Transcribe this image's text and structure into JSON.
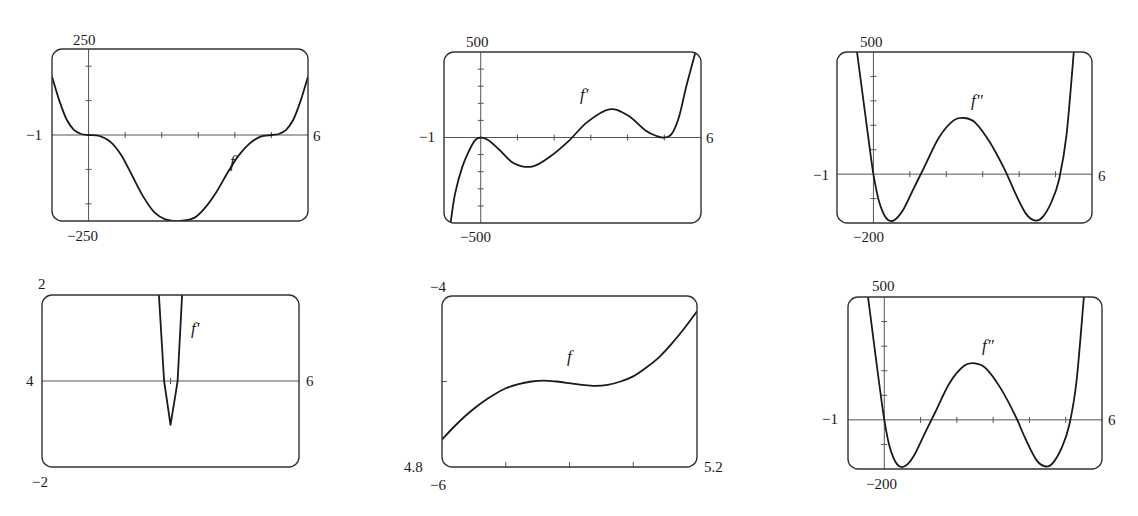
{
  "figure": {
    "stroke_color": "#1a1a1a",
    "frame_color": "#333333",
    "axis_color": "#555555",
    "background": "#ffffff"
  },
  "chart_data": [
    {
      "type": "line",
      "id": "p1",
      "curve_label": "f",
      "box": {
        "left": 52,
        "top": 49,
        "right": 308,
        "bottom": 221
      },
      "xlim": [
        -1,
        6
      ],
      "ylim": [
        -250,
        250
      ],
      "labels": {
        "ymax": "250",
        "ymin": "−250",
        "xmin": "−1",
        "xmax": "6"
      },
      "x_axis_y": 0,
      "y_axis_x": 0,
      "xticks": [
        1,
        2,
        3,
        4,
        5
      ],
      "yticks": [
        -200,
        -100,
        100,
        200
      ],
      "label_pos": {
        "ymax": [
          73,
          33
        ],
        "ymin": [
          67,
          229
        ],
        "xmin": [
          26,
          128
        ],
        "xmax": [
          313,
          129
        ],
        "fn": [
          230,
          153
        ]
      },
      "series": [
        {
          "name": "f",
          "x": [
            -1,
            -0.8,
            -0.6,
            -0.4,
            -0.2,
            0,
            0.3,
            0.6,
            0.9,
            1.2,
            1.5,
            1.8,
            2.1,
            2.5,
            2.9,
            3.2,
            3.5,
            3.8,
            4.1,
            4.4,
            4.7,
            5,
            5.2,
            5.4,
            5.6,
            5.8,
            6
          ],
          "y": [
            170,
            100,
            45,
            15,
            3,
            0,
            -3,
            -20,
            -60,
            -120,
            -180,
            -225,
            -245,
            -250,
            -240,
            -210,
            -165,
            -110,
            -60,
            -25,
            -5,
            0,
            3,
            15,
            45,
            100,
            170
          ]
        }
      ]
    },
    {
      "type": "line",
      "id": "p2",
      "curve_label": "f′",
      "box": {
        "left": 444,
        "top": 52,
        "right": 701,
        "bottom": 223
      },
      "xlim": [
        -1,
        6
      ],
      "ylim": [
        -500,
        500
      ],
      "labels": {
        "ymax": "500",
        "ymin": "−500",
        "xmin": "−1",
        "xmax": "6"
      },
      "x_axis_y": 0,
      "y_axis_x": 0,
      "xticks": [
        1,
        2,
        3,
        4,
        5
      ],
      "yticks": [
        -400,
        -300,
        -200,
        -100,
        100,
        200,
        300,
        400
      ],
      "label_pos": {
        "ymax": [
          466,
          35
        ],
        "ymin": [
          460,
          230
        ],
        "xmin": [
          419,
          130
        ],
        "xmax": [
          706,
          131
        ],
        "fn": [
          580,
          86
        ]
      },
      "series": [
        {
          "name": "f′",
          "x": [
            -0.82,
            -0.7,
            -0.5,
            -0.3,
            -0.15,
            0,
            0.2,
            0.5,
            0.9,
            1.4,
            1.9,
            2.4,
            2.9,
            3.5,
            4.0,
            4.5,
            4.8,
            5.0,
            5.2,
            5.4,
            5.6,
            5.85
          ],
          "y": [
            -500,
            -330,
            -170,
            -70,
            -15,
            0,
            -15,
            -70,
            -150,
            -170,
            -110,
            -20,
            90,
            165,
            130,
            40,
            8,
            0,
            20,
            120,
            300,
            500
          ]
        }
      ]
    },
    {
      "type": "line",
      "id": "p3",
      "curve_label": "f″",
      "box": {
        "left": 837,
        "top": 52,
        "right": 1092,
        "bottom": 223
      },
      "xlim": [
        -1,
        6
      ],
      "ylim": [
        -200,
        500
      ],
      "labels": {
        "ymax": "500",
        "ymin": "−200",
        "xmin": "−1",
        "xmax": "6"
      },
      "x_axis_y": 0,
      "y_axis_x": 0,
      "xticks": [
        1,
        2,
        3,
        4,
        5
      ],
      "yticks": [
        -100,
        100,
        200,
        300,
        400
      ],
      "label_pos": {
        "ymax": [
          860,
          35
        ],
        "ymin": [
          853,
          230
        ],
        "xmin": [
          813,
          168
        ],
        "xmax": [
          1098,
          169
        ],
        "fn": [
          971,
          92
        ]
      },
      "series": [
        {
          "name": "f″",
          "x": [
            -0.45,
            -0.3,
            -0.15,
            0,
            0.15,
            0.35,
            0.55,
            0.8,
            1.1,
            1.4,
            1.8,
            2.2,
            2.5,
            2.8,
            3.2,
            3.6,
            3.9,
            4.2,
            4.45,
            4.65,
            4.9,
            5.1,
            5.3,
            5.5
          ],
          "y": [
            500,
            330,
            160,
            0,
            -110,
            -180,
            -190,
            -150,
            -60,
            30,
            150,
            220,
            230,
            210,
            130,
            20,
            -80,
            -165,
            -190,
            -175,
            -110,
            -20,
            160,
            500
          ]
        }
      ]
    },
    {
      "type": "line",
      "id": "p4",
      "curve_label": "f′",
      "box": {
        "left": 42,
        "top": 295,
        "right": 299,
        "bottom": 467
      },
      "xlim": [
        4,
        6
      ],
      "ylim": [
        -2,
        2
      ],
      "labels": {
        "ymax": "2",
        "ymin": "−2",
        "xmin": "4",
        "xmax": "6"
      },
      "x_axis_y": 0,
      "y_axis_x": null,
      "xticks": [
        5
      ],
      "yticks": [],
      "label_pos": {
        "ymax": [
          38,
          277
        ],
        "ymin": [
          32,
          475
        ],
        "xmin": [
          26,
          374
        ],
        "xmax": [
          306,
          374
        ],
        "fn": [
          191,
          320
        ]
      },
      "series": [
        {
          "name": "f′",
          "x": [
            4.91,
            4.95,
            4.965,
            5.0,
            5.04,
            5.055,
            5.09
          ],
          "y": [
            2,
            0,
            -0.3,
            -1.02,
            -0.3,
            0,
            2
          ]
        }
      ]
    },
    {
      "type": "line",
      "id": "p5",
      "curve_label": "f",
      "box": {
        "left": 442,
        "top": 296,
        "right": 697,
        "bottom": 467
      },
      "xlim": [
        4.8,
        5.2
      ],
      "ylim": [
        -6,
        -4
      ],
      "labels": {
        "ymax": "−4",
        "ymin": "−6",
        "xmin": "4.8",
        "xmax": "5.2"
      },
      "x_axis_y": null,
      "y_axis_x": null,
      "xticks": [
        4.9,
        5.0,
        5.1
      ],
      "yticks": [
        -5
      ],
      "left_axis_ticks": true,
      "label_pos": {
        "ymax": [
          430,
          280
        ],
        "ymin": [
          430,
          478
        ],
        "xmin": [
          404,
          460
        ],
        "xmax": [
          704,
          460
        ],
        "fn": [
          567,
          348
        ]
      },
      "series": [
        {
          "name": "f",
          "x": [
            4.8,
            4.82,
            4.84,
            4.86,
            4.88,
            4.9,
            4.92,
            4.94,
            4.96,
            4.98,
            5.0,
            5.02,
            5.04,
            5.06,
            5.08,
            5.1,
            5.12,
            5.14,
            5.16,
            5.18,
            5.2
          ],
          "y": [
            -5.68,
            -5.52,
            -5.38,
            -5.26,
            -5.16,
            -5.08,
            -5.03,
            -5.0,
            -4.99,
            -5.0,
            -5.02,
            -5.04,
            -5.05,
            -5.04,
            -5.0,
            -4.94,
            -4.84,
            -4.72,
            -4.56,
            -4.38,
            -4.18
          ]
        }
      ]
    },
    {
      "type": "line",
      "id": "p6",
      "curve_label": "f″",
      "box": {
        "left": 848,
        "top": 297,
        "right": 1102,
        "bottom": 469
      },
      "xlim": [
        -1,
        6
      ],
      "ylim": [
        -200,
        500
      ],
      "labels": {
        "ymax": "500",
        "ymin": "−200",
        "xmin": "−1",
        "xmax": "6"
      },
      "x_axis_y": 0,
      "y_axis_x": 0,
      "xticks": [
        1,
        2,
        3,
        4,
        5
      ],
      "yticks": [
        -100,
        100,
        200,
        300,
        400
      ],
      "label_pos": {
        "ymax": [
          872,
          279
        ],
        "ymin": [
          866,
          477
        ],
        "xmin": [
          822,
          412
        ],
        "xmax": [
          1108,
          413
        ],
        "fn": [
          982,
          337
        ]
      },
      "series": [
        {
          "name": "f″",
          "x": [
            -0.45,
            -0.3,
            -0.15,
            0,
            0.15,
            0.35,
            0.55,
            0.8,
            1.1,
            1.4,
            1.8,
            2.2,
            2.5,
            2.8,
            3.2,
            3.6,
            3.9,
            4.2,
            4.45,
            4.65,
            4.9,
            5.1,
            5.3,
            5.5
          ],
          "y": [
            500,
            330,
            160,
            0,
            -110,
            -180,
            -190,
            -150,
            -60,
            30,
            150,
            220,
            230,
            210,
            130,
            20,
            -80,
            -165,
            -190,
            -175,
            -110,
            -20,
            160,
            500
          ]
        }
      ]
    }
  ]
}
